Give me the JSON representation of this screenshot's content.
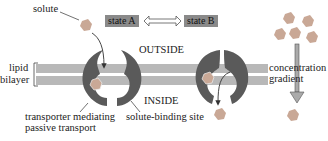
{
  "diagram": {
    "labels": {
      "solute": "solute",
      "state_a": "state A",
      "state_b": "state B",
      "outside": "OUTSIDE",
      "inside": "INSIDE",
      "lipid_bilayer_line1": "lipid",
      "lipid_bilayer_line2": "bilayer",
      "transporter_line1": "transporter mediating",
      "transporter_line2": "passive transport",
      "solute_binding_site": "solute-binding site",
      "concentration_line1": "concentration",
      "concentration_line2": "gradient"
    },
    "colors": {
      "membrane": "#b4b4b4",
      "transporter": "#5a5a5a",
      "solute": "#c0a090",
      "state_box": "#8a8a8a",
      "arrow": "#333333"
    }
  }
}
